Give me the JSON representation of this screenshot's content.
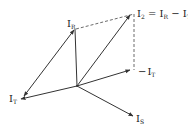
{
  "diagram": {
    "type": "phasor-diagram",
    "origin": [
      77,
      86
    ],
    "stroke_color": "#333333",
    "labels": {
      "i_r": {
        "main": "I",
        "sub": "R"
      },
      "i_t": {
        "main": "I",
        "sub": "T"
      },
      "neg_i_t": {
        "prefix": "−",
        "main": "I",
        "sub": "T"
      },
      "i_s": {
        "main": "I",
        "sub": "S"
      },
      "i_2": {
        "main": "I",
        "sub": "2",
        "eq": " = ",
        "rhs1": "I",
        "rhs1_sub": "R",
        "minus": " − ",
        "rhs2": "I",
        "rhs2_sub": "T"
      }
    },
    "vectors": [
      {
        "name": "I_R",
        "from": [
          77,
          86
        ],
        "to": [
          75,
          29
        ],
        "arrow": false
      },
      {
        "name": "I_2",
        "from": [
          77,
          86
        ],
        "to": [
          130,
          15
        ],
        "arrow": true
      },
      {
        "name": "-I_T",
        "from": [
          77,
          86
        ],
        "to": [
          130,
          70
        ],
        "arrow": true
      },
      {
        "name": "I_T",
        "from": [
          77,
          86
        ],
        "to": [
          21,
          99
        ],
        "arrow": true
      },
      {
        "name": "I_S",
        "from": [
          77,
          86
        ],
        "to": [
          133,
          116
        ],
        "arrow": true
      },
      {
        "name": "I_T_to_I_R",
        "from": [
          24,
          96
        ],
        "to": [
          74,
          30
        ],
        "arrow": "both"
      }
    ],
    "dashed": [
      {
        "from": [
          76,
          29
        ],
        "to": [
          134,
          14
        ]
      },
      {
        "from": [
          134,
          14
        ],
        "to": [
          134,
          70
        ]
      }
    ]
  }
}
